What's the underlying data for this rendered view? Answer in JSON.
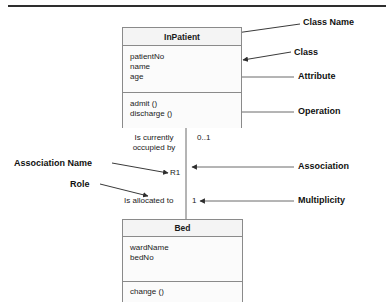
{
  "diagram": {
    "title_rule": true,
    "colors": {
      "ink": "#1a1a1a",
      "box_border": "#8a8a8a",
      "box_fill": "#fbfbfb",
      "header_fill": "#f4f4f4",
      "leader": "#3a3a3a",
      "top_rule": "#2e2e2e"
    }
  },
  "classes": [
    {
      "id": "inpatient",
      "name": "InPatient",
      "attributes": [
        "patientNo",
        "name",
        "age"
      ],
      "operations": [
        "admit ()",
        "discharge ()"
      ]
    },
    {
      "id": "bed",
      "name": "Bed",
      "attributes": [
        "wardName",
        "bedNo"
      ],
      "operations": [
        "change ()"
      ]
    }
  ],
  "association": {
    "name_line1": "Is currently",
    "name_line2": "occupied by",
    "identifier": "R1",
    "role": "Is allocated to",
    "multiplicity_top": "0..1",
    "multiplicity_bottom": "1"
  },
  "callouts": {
    "class_name": "Class Name",
    "class": "Class",
    "attribute": "Attribute",
    "operation": "Operation",
    "association": "Association",
    "multiplicity": "Multiplicity",
    "association_name": "Association Name",
    "role": "Role"
  }
}
